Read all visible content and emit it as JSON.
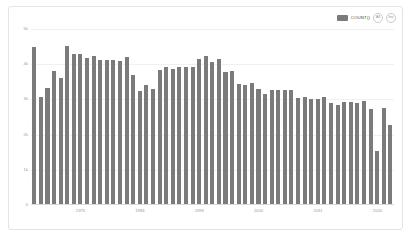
{
  "legend": {
    "series_label": "COUNT()",
    "swatch_color": "#7b7b7b",
    "buttons": [
      {
        "name": "all-toggle",
        "label": "All"
      },
      {
        "name": "inv-toggle",
        "label": "Inv"
      }
    ]
  },
  "chart_data": {
    "type": "bar",
    "title": "",
    "xlabel": "",
    "ylabel": "",
    "grid": true,
    "legend_position": "top-right",
    "ylim": [
      0,
      5000
    ],
    "ytick_labels": [
      "0",
      "1k",
      "2k",
      "3k",
      "4k",
      "5k"
    ],
    "ytick_values": [
      0,
      1000,
      2000,
      3000,
      4000,
      5000
    ],
    "xtick_labels": [
      "1975",
      "1984",
      "1993",
      "2002",
      "2011",
      "2020"
    ],
    "xtick_values": [
      1975,
      1984,
      1993,
      2002,
      2011,
      2020
    ],
    "bar_color": "#7b7b7b",
    "categories": [
      1968,
      1969,
      1970,
      1971,
      1972,
      1973,
      1974,
      1975,
      1976,
      1977,
      1978,
      1979,
      1980,
      1981,
      1982,
      1983,
      1984,
      1985,
      1986,
      1987,
      1988,
      1989,
      1990,
      1991,
      1992,
      1993,
      1994,
      1995,
      1996,
      1997,
      1998,
      1999,
      2000,
      2001,
      2002,
      2003,
      2004,
      2005,
      2006,
      2007,
      2008,
      2009,
      2010,
      2011,
      2012,
      2013,
      2014,
      2015,
      2016,
      2017,
      2018,
      2019,
      2020,
      2021,
      2022
    ],
    "values": [
      4500,
      3080,
      3320,
      3800,
      3620,
      4520,
      4280,
      4300,
      4180,
      4220,
      4110,
      4130,
      4130,
      4100,
      4210,
      3680,
      3240,
      3400,
      3300,
      3830,
      3930,
      3860,
      3930,
      3920,
      3930,
      4150,
      4220,
      4060,
      4150,
      3790,
      3800,
      3450,
      3400,
      3470,
      3300,
      3160,
      3260,
      3270,
      3270,
      3280,
      3040,
      3060,
      3020,
      3010,
      3060,
      2900,
      2830,
      2930,
      2930,
      2900,
      2960,
      2740,
      1540,
      2770,
      2280
    ]
  }
}
